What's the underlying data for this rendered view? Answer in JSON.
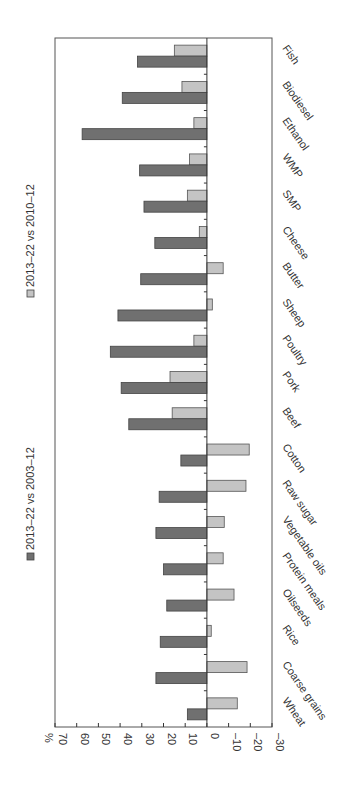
{
  "chart_data": {
    "type": "bar",
    "orientation": "vertical bars, image rotated 90° clockwise",
    "title": "",
    "xlabel": "",
    "ylabel": "%",
    "ylim": [
      -30,
      70
    ],
    "yticks": [
      70,
      60,
      50,
      40,
      30,
      20,
      10,
      0,
      -10,
      -20,
      -30
    ],
    "ytick_labels": [
      "70",
      "60",
      "50",
      "40",
      "30",
      "20",
      "10",
      "0",
      "–10",
      "–20",
      "–30"
    ],
    "grid": false,
    "legend_position": "top (left side in rotated image)",
    "categories": [
      "Wheat",
      "Coarse grains",
      "Rice",
      "Oilseeds",
      "Protein meals",
      "Vegetable oils",
      "Raw sugar",
      "Cotton",
      "Beef",
      "Pork",
      "Poultry",
      "Sheep",
      "Butter",
      "Cheese",
      "SMP",
      "WMP",
      "Ethanol",
      "Biodiesel",
      "Fish"
    ],
    "series": [
      {
        "name": "2013–22 vs 2003–12",
        "color": "#707070",
        "values": [
          9,
          23.5,
          21.5,
          18.5,
          20,
          23.5,
          22,
          12,
          36,
          39.5,
          44.5,
          41,
          30.5,
          24,
          29,
          31,
          57.5,
          39,
          32
        ]
      },
      {
        "name": "2013–22 vs 2010–12",
        "color": "#c4c4c4",
        "values": [
          -14,
          -18.5,
          -2,
          -12.5,
          -7.5,
          -8,
          -18,
          -19.5,
          16,
          17,
          6,
          -2.5,
          -7.5,
          3.5,
          9,
          8,
          6,
          11.5,
          15
        ]
      }
    ]
  },
  "labels": {
    "percent_unit": "%",
    "legend_dark": "2013–22 vs 2003–12",
    "legend_light": "2013–22 vs 2010–12"
  },
  "colors": {
    "dark": "#707070",
    "light": "#c4c4c4",
    "frame": "#555555",
    "background": "#ffffff"
  }
}
